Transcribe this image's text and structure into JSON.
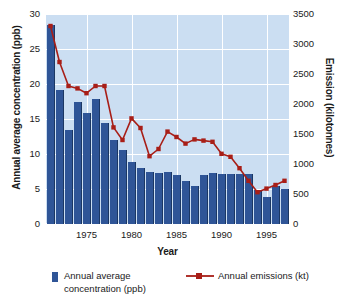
{
  "chart_data": {
    "type": "bar",
    "title": "",
    "xlabel": "Year",
    "ylabel": "Annual average concentration (ppb)",
    "ylabel_right": "Emission (kilotonnes)",
    "grid": true,
    "legend_position": "bottom",
    "ylim": [
      0,
      30
    ],
    "ylim_right": [
      0,
      3500
    ],
    "yticks": [
      "0",
      "5",
      "10",
      "15",
      "20",
      "25",
      "30"
    ],
    "ytick_values": [
      0,
      5,
      10,
      15,
      20,
      25,
      30
    ],
    "yticks_right": [
      "0",
      "500",
      "1000",
      "1500",
      "2000",
      "2500",
      "3000",
      "3500"
    ],
    "ytick_values_right": [
      0,
      500,
      1000,
      1500,
      2000,
      2500,
      3000,
      3500
    ],
    "xticks": [
      "1975",
      "1980",
      "1985",
      "1990",
      "1995"
    ],
    "xtick_values": [
      1975,
      1980,
      1985,
      1990,
      1995
    ],
    "categories": [
      1971,
      1972,
      1973,
      1974,
      1975,
      1976,
      1977,
      1978,
      1979,
      1980,
      1981,
      1982,
      1983,
      1984,
      1985,
      1986,
      1987,
      1988,
      1989,
      1990,
      1991,
      1992,
      1993,
      1994,
      1995,
      1996,
      1997
    ],
    "series": [
      {
        "name": "Annual average concentration (ppb)",
        "type": "bar",
        "axis": "left",
        "unit": "ppb",
        "color": "#2f5597",
        "values": [
          28.5,
          19.1,
          13.5,
          17.4,
          15.9,
          17.9,
          14.5,
          12.0,
          10.6,
          8.9,
          8.0,
          7.5,
          7.3,
          7.4,
          7.0,
          6.1,
          5.5,
          7.0,
          7.3,
          7.2,
          7.2,
          7.2,
          7.1,
          4.9,
          3.9,
          5.4,
          5.0
        ]
      },
      {
        "name": "Annual emissions (kt)",
        "type": "line",
        "axis": "right",
        "unit": "kt",
        "color": "#a81e17",
        "marker": "square",
        "values": [
          3300,
          2700,
          2300,
          2260,
          2180,
          2300,
          2300,
          1610,
          1400,
          1760,
          1600,
          1130,
          1250,
          1540,
          1450,
          1340,
          1410,
          1390,
          1370,
          1170,
          1120,
          930,
          720,
          530,
          590,
          650,
          720
        ]
      }
    ]
  },
  "legend": {
    "bar_label": "Annual average concentration (ppb)",
    "line_label": "Annual emissions (kt)"
  },
  "axes": {
    "left_title": "Annual average concentration (ppb)",
    "right_title": "Emission (kilotonnes)",
    "x_title": "Year"
  },
  "colors": {
    "bar": "#2f5597",
    "line": "#a81e17",
    "plot_background": "#cbdef2",
    "gridline": "#ffffff",
    "text": "#1a1a1a"
  }
}
